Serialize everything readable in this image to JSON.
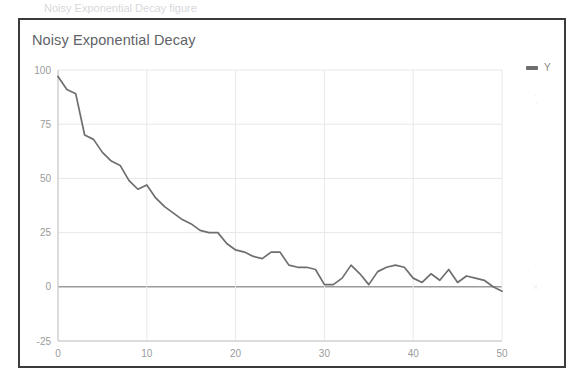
{
  "top_strip": {
    "text": "Noisy Exponential Decay figure"
  },
  "legend": {
    "label": "Y",
    "marker": "line-dash-icon",
    "position": "right"
  },
  "colors": {
    "line": "#6e6e6e",
    "grid": "#e8e8e8",
    "zero_line": "#9a9a9a",
    "axis_text": "#9a9a9a",
    "title_text": "#5f6368",
    "frame": "#3b3b3b",
    "background": "#ffffff"
  },
  "chart_data": {
    "type": "line",
    "title": "Noisy Exponential Decay",
    "xlabel": "",
    "ylabel": "",
    "xlim": [
      0,
      50
    ],
    "ylim": [
      -25,
      100
    ],
    "xticks": [
      0,
      10,
      20,
      30,
      40,
      50
    ],
    "yticks": [
      -25,
      0,
      25,
      50,
      75,
      100
    ],
    "grid": true,
    "legend_position": "right",
    "series": [
      {
        "name": "Y",
        "color": "#6e6e6e",
        "x": [
          0,
          1,
          2,
          3,
          4,
          5,
          6,
          7,
          8,
          9,
          10,
          11,
          12,
          13,
          14,
          15,
          16,
          17,
          18,
          19,
          20,
          21,
          22,
          23,
          24,
          25,
          26,
          27,
          28,
          29,
          30,
          31,
          32,
          33,
          34,
          35,
          36,
          37,
          38,
          39,
          40,
          41,
          42,
          43,
          44,
          45,
          46,
          47,
          48,
          49,
          50
        ],
        "values": [
          97,
          91,
          89,
          70,
          68,
          62,
          58,
          56,
          49,
          45,
          47,
          41,
          37,
          34,
          31,
          29,
          26,
          25,
          25,
          20,
          17,
          16,
          14,
          13,
          16,
          16,
          10,
          9,
          9,
          8,
          1,
          1,
          4,
          10,
          6,
          1,
          7,
          9,
          10,
          9,
          4,
          2,
          6,
          3,
          8,
          2,
          5,
          4,
          3,
          0,
          -2
        ]
      }
    ]
  }
}
